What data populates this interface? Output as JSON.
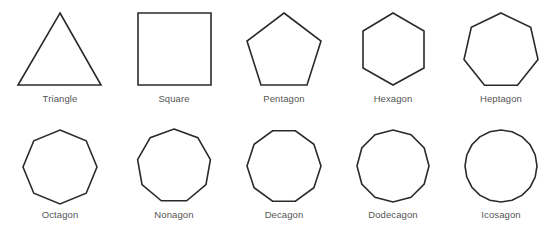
{
  "diagram": {
    "title": "",
    "stroke_color": "#2a2a2a",
    "label_color": "#555555",
    "shapes": [
      {
        "name": "Triangle",
        "sides": 3,
        "row": 0,
        "cx": 60,
        "label_y": 93
      },
      {
        "name": "Square",
        "sides": 4,
        "row": 0,
        "cx": 174,
        "label_y": 93
      },
      {
        "name": "Pentagon",
        "sides": 5,
        "row": 0,
        "cx": 284,
        "label_y": 93
      },
      {
        "name": "Hexagon",
        "sides": 6,
        "row": 0,
        "cx": 393,
        "label_y": 93
      },
      {
        "name": "Heptagon",
        "sides": 7,
        "row": 0,
        "cx": 501,
        "label_y": 93
      },
      {
        "name": "Octagon",
        "sides": 8,
        "row": 1,
        "cx": 60,
        "label_y": 209
      },
      {
        "name": "Nonagon",
        "sides": 9,
        "row": 1,
        "cx": 174,
        "label_y": 209
      },
      {
        "name": "Decagon",
        "sides": 10,
        "row": 1,
        "cx": 284,
        "label_y": 209
      },
      {
        "name": "Dodecagon",
        "sides": 12,
        "row": 1,
        "cx": 393,
        "label_y": 209
      },
      {
        "name": "Icosagon",
        "sides": 20,
        "row": 1,
        "cx": 501,
        "label_y": 209
      }
    ]
  }
}
